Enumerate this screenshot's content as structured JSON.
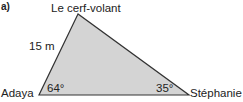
{
  "part_label": "a)",
  "vertices": {
    "top": "Le cerf-volant",
    "left": "Adaya",
    "right": "Stéphanie"
  },
  "side_label": "15 m",
  "angles": {
    "left": "64°",
    "right": "35°"
  },
  "colors": {
    "fill": "#d4d4d4",
    "stroke": "#333333"
  }
}
